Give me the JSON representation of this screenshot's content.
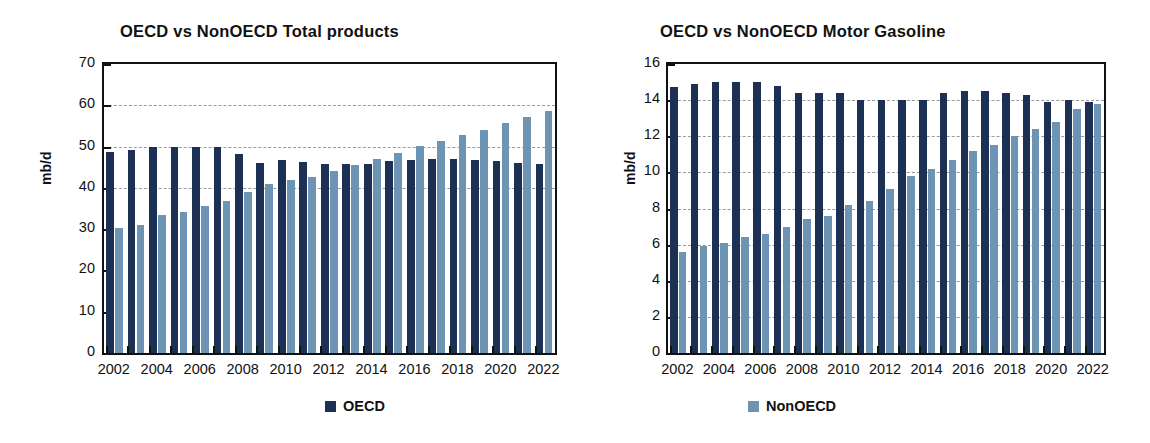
{
  "colors": {
    "oecd": "#1c3054",
    "nonoecd": "#6d95b3",
    "axis": "#111111",
    "gridline": "#9a9a9a",
    "background": "#ffffff"
  },
  "legend": {
    "oecd_label": "OECD",
    "nonoecd_label": "NonOECD"
  },
  "chart_data": [
    {
      "id": "total-products",
      "type": "bar",
      "title": "OECD vs NonOECD Total products",
      "xlabel": "",
      "ylabel": "mb/d",
      "ylim": [
        0,
        70
      ],
      "yticks": [
        0,
        10,
        20,
        30,
        40,
        50,
        60,
        70
      ],
      "ytick_labels": [
        "0",
        "10",
        "20",
        "30",
        "40",
        "50",
        "60",
        "70"
      ],
      "grid": true,
      "gridlines_at": [
        40,
        50,
        60
      ],
      "legend_position": "bottom",
      "categories": [
        2002,
        2003,
        2004,
        2005,
        2006,
        2007,
        2008,
        2009,
        2010,
        2011,
        2012,
        2013,
        2014,
        2015,
        2016,
        2017,
        2018,
        2019,
        2020,
        2021,
        2022
      ],
      "xtick_labels": [
        "2002",
        "2004",
        "2006",
        "2008",
        "2010",
        "2012",
        "2014",
        "2016",
        "2018",
        "2020",
        "2022"
      ],
      "series": [
        {
          "name": "OECD",
          "color": "#1c3054",
          "values": [
            48.7,
            49.1,
            49.8,
            50.0,
            49.9,
            49.8,
            48.3,
            46.1,
            46.7,
            46.2,
            45.8,
            45.9,
            45.8,
            46.5,
            46.8,
            46.9,
            46.9,
            46.7,
            46.5,
            46.1,
            45.8
          ]
        },
        {
          "name": "NonOECD",
          "color": "#6d95b3",
          "values": [
            30.2,
            31.0,
            33.4,
            34.2,
            35.5,
            36.8,
            38.9,
            41.0,
            41.9,
            42.7,
            44.2,
            45.6,
            46.9,
            48.5,
            50.1,
            51.3,
            52.8,
            54.1,
            55.7,
            57.1,
            58.5
          ]
        }
      ]
    },
    {
      "id": "motor-gasoline",
      "type": "bar",
      "title": "OECD vs NonOECD Motor Gasoline",
      "xlabel": "",
      "ylabel": "mb/d",
      "ylim": [
        0,
        16
      ],
      "yticks": [
        0,
        2,
        4,
        6,
        8,
        10,
        12,
        14,
        16
      ],
      "ytick_labels": [
        "0",
        "2",
        "4",
        "6",
        "8",
        "10",
        "12",
        "14",
        "16"
      ],
      "grid": true,
      "gridlines_at": [
        2,
        4,
        6,
        8,
        10,
        12,
        14
      ],
      "legend_position": "bottom",
      "categories": [
        2002,
        2003,
        2004,
        2005,
        2006,
        2007,
        2008,
        2009,
        2010,
        2011,
        2012,
        2013,
        2014,
        2015,
        2016,
        2017,
        2018,
        2019,
        2020,
        2021,
        2022
      ],
      "xtick_labels": [
        "2002",
        "2004",
        "2006",
        "2008",
        "2010",
        "2012",
        "2014",
        "2016",
        "2018",
        "2020",
        "2022"
      ],
      "series": [
        {
          "name": "OECD",
          "color": "#1c3054",
          "values": [
            14.7,
            14.9,
            15.0,
            15.0,
            15.0,
            14.8,
            14.4,
            14.4,
            14.4,
            14.0,
            14.0,
            14.0,
            14.0,
            14.4,
            14.5,
            14.5,
            14.4,
            14.3,
            13.9,
            14.0,
            13.9
          ]
        },
        {
          "name": "NonOECD",
          "color": "#6d95b3",
          "values": [
            5.6,
            5.9,
            6.1,
            6.4,
            6.6,
            7.0,
            7.4,
            7.6,
            8.2,
            8.4,
            9.1,
            9.8,
            10.2,
            10.7,
            11.2,
            11.5,
            12.0,
            12.4,
            12.8,
            13.5,
            13.8
          ]
        }
      ]
    }
  ]
}
